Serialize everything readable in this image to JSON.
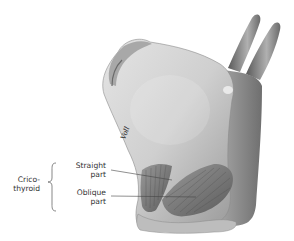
{
  "figure": {
    "signature": "Voll",
    "labels": {
      "group": "Crico-\nthyroid",
      "group_line1": "Crico-",
      "group_line2": "thyroid",
      "straight_line1": "Straight",
      "straight_line2": "part",
      "oblique_line1": "Oblique",
      "oblique_line2": "part"
    },
    "colors": {
      "cartilage_light": "#d9d9d9",
      "cartilage_mid": "#b5b5b5",
      "cartilage_dark": "#7a7a7a",
      "muscle": "#6e6e6e",
      "text": "#333333",
      "leader": "#444444"
    }
  }
}
